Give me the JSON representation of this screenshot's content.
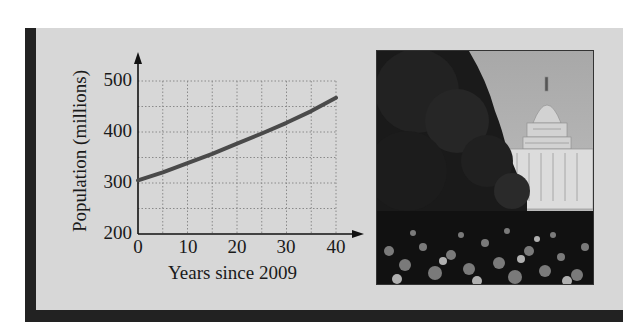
{
  "chart_data": {
    "type": "line",
    "title": "",
    "xlabel": "Years since 2009",
    "ylabel": "Population (millions)",
    "x_ticks": [
      "0",
      "10",
      "20",
      "30",
      "40"
    ],
    "y_ticks": [
      "200",
      "300",
      "400",
      "500"
    ],
    "xlim": [
      0,
      40
    ],
    "ylim": [
      200,
      500
    ],
    "grid": true,
    "grid_style": "dotted, every 5 years and every 50 million",
    "legend": null,
    "series": [
      {
        "name": "Population",
        "x": [
          0,
          5,
          10,
          15,
          20,
          25,
          30,
          35,
          40
        ],
        "values": [
          305,
          321,
          339,
          357,
          377,
          397,
          418,
          441,
          467
        ]
      }
    ]
  },
  "figure": {
    "photo_description": "Crowd of people on a tree-lined street with the U.S. Capitol dome in the background"
  },
  "colors": {
    "panel": "#d7d7d7",
    "frame_bar": "#222222",
    "curve": "#4a4a4a",
    "grid": "#8a8a8a"
  }
}
